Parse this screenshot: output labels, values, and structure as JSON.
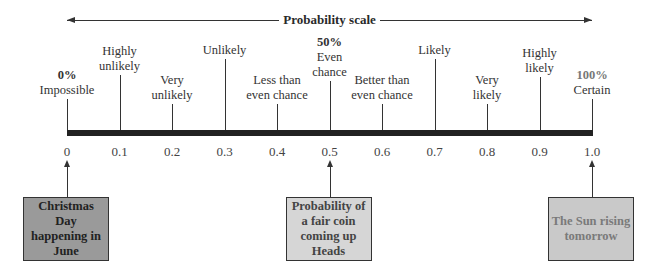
{
  "title": "Probability scale",
  "axis": {
    "ticks": [
      "0",
      "0.1",
      "0.2",
      "0.3",
      "0.4",
      "0.5",
      "0.6",
      "0.7",
      "0.8",
      "0.9",
      "1.0"
    ]
  },
  "descriptors": [
    {
      "value": 0.0,
      "pct": "0%",
      "label_lines": [
        "Impossible"
      ]
    },
    {
      "value": 0.1,
      "label_lines": [
        "Highly",
        "unlikely"
      ]
    },
    {
      "value": 0.2,
      "label_lines": [
        "Very",
        "unlikely"
      ]
    },
    {
      "value": 0.3,
      "label_lines": [
        "Unlikely"
      ]
    },
    {
      "value": 0.4,
      "label_lines": [
        "Less than",
        "even chance"
      ]
    },
    {
      "value": 0.5,
      "pct": "50%",
      "label_lines": [
        "Even",
        "chance"
      ]
    },
    {
      "value": 0.6,
      "label_lines": [
        "Better than",
        "even chance"
      ]
    },
    {
      "value": 0.7,
      "label_lines": [
        "Likely"
      ]
    },
    {
      "value": 0.8,
      "label_lines": [
        "Very",
        "likely"
      ]
    },
    {
      "value": 0.9,
      "label_lines": [
        "Highly",
        "likely"
      ]
    },
    {
      "value": 1.0,
      "pct": "100%",
      "label_lines": [
        "Certain"
      ]
    }
  ],
  "examples": [
    {
      "value": 0.0,
      "text_lines": [
        "Christmas Day",
        "happening in",
        "June"
      ],
      "fill": "#9a9a9a",
      "text_color": "#222222"
    },
    {
      "value": 0.5,
      "text_lines": [
        "Probability of",
        "a fair coin",
        "coming up Heads"
      ],
      "fill": "#d6d6d6",
      "text_color": "#444444"
    },
    {
      "value": 1.0,
      "text_lines": [
        "The Sun rising",
        "tomorrow"
      ],
      "fill": "#c9c9c9",
      "text_color": "#7a7a7a"
    }
  ],
  "colors": {
    "bar": "#222222",
    "pct_100": "#777777"
  }
}
